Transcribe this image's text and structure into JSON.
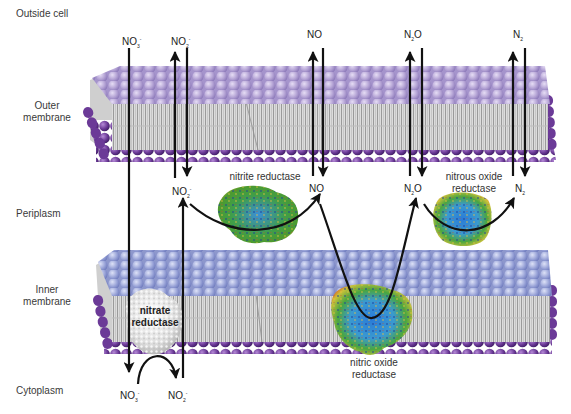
{
  "regions": {
    "outside": "Outside cell",
    "outer_membrane_1": "Outer",
    "outer_membrane_2": "membrane",
    "periplasm": "Periplasm",
    "inner_membrane_1": "Inner",
    "inner_membrane_2": "membrane",
    "cytoplasm": "Cytoplasm"
  },
  "species": {
    "nitrate": {
      "base": "NO",
      "sub": "3",
      "sup": "-"
    },
    "nitrite": {
      "base": "NO",
      "sub": "2",
      "sup": "-"
    },
    "nitric_oxide": {
      "base": "NO"
    },
    "nitrous_oxide": {
      "pre": "N",
      "sub": "2",
      "post": "O"
    },
    "nitrogen": {
      "base": "N",
      "sub": "2"
    }
  },
  "enzymes": {
    "nitrate_reductase_1": "nitrate",
    "nitrate_reductase_2": "reductase",
    "nitrite_reductase": "nitrite reductase",
    "nitric_oxide_reductase_1": "nitric oxide",
    "nitric_oxide_reductase_2": "reductase",
    "nitrous_oxide_reductase_1": "nitrous oxide",
    "nitrous_oxide_reductase_2": "reductase"
  },
  "colors": {
    "outer_head_top": "#b7a7d6",
    "inner_head_top": "#9ea8d8",
    "lower_head": "#6a3f96",
    "tail": "#d4d4d4",
    "arrow": "#111111"
  }
}
